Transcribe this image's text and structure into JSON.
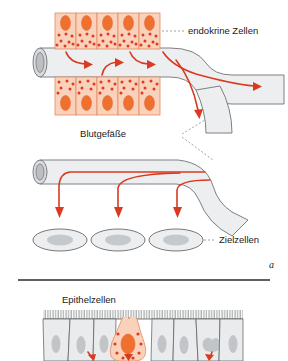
{
  "figure": {
    "title_visible": false,
    "language": "de",
    "panels": [
      {
        "id": "a",
        "marker": "a",
        "description": "Endokrine Zellen geben Hormone in Blutgefäße ab, die sie zu Zielzellen transportieren",
        "labels": [
          {
            "key": "endocrine_cells",
            "text": "endokrine Zellen"
          },
          {
            "key": "blood_vessels",
            "text": "Blutgefäße"
          },
          {
            "key": "target_cells",
            "text": "Zielzellen"
          }
        ],
        "counts": {
          "endocrine_cells_top_row": 5,
          "endocrine_cells_bottom_row": 5,
          "target_cells": 3,
          "secretion_arrows_into_vessel": 4,
          "arrows_to_target_cells": 3,
          "vessel_branches": 3
        }
      },
      {
        "id": "b",
        "marker": "",
        "description": "Epithelzellen mit einer einzelnen endokrinen Zelle im Verband",
        "labels": [
          {
            "key": "epithelial_cells",
            "text": "Epithelzellen"
          }
        ],
        "counts": {
          "epithelial_cells": 9,
          "endocrine_cell": 1,
          "basal_arrows": 3
        }
      }
    ],
    "colors": {
      "endocrine_cell_fill": "#fad2bb",
      "endocrine_cell_outline": "#e08a5e",
      "nucleus": "#f07030",
      "granule": "#e03a20",
      "arrow": "#d93a22",
      "vessel_fill": "#edeef0",
      "vessel_outline": "#6f7276",
      "vessel_lumen": "#d8dadd",
      "target_cell_fill": "#eceef0",
      "target_cell_nucleus": "#c6c9cc",
      "epithelium_fill": "#e9ebed",
      "leader_line": "#8a8a8a",
      "divider": "#2b2b2b"
    }
  }
}
